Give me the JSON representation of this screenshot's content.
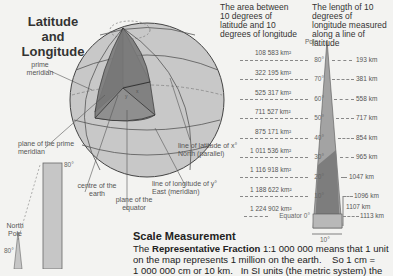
{
  "globe": {
    "title_line1": "Latitude and",
    "title_line2": "Longitude",
    "labels": {
      "prime_meridian": "prime meridian",
      "plane_prime_meridian": "plane of the prime meridian",
      "line_of_latitude": "line of latitude of x° North (parallel)",
      "line_of_longitude": "line of longitude of y° East (meridian)",
      "centre_of_earth": "centre of the earth",
      "plane_of_equator": "plane of the equator",
      "x": "x",
      "y": "y"
    },
    "colors": {
      "light": "#c8c8c8",
      "mid": "#8f8f8f",
      "dark": "#6e6e6e",
      "outline": "#444444"
    }
  },
  "left_mini": {
    "north_pole": "North Pole",
    "deg80_top": "80°",
    "deg80_left": "80°"
  },
  "area_column": {
    "header": "The area between 10 degrees of latitude and 10 degrees of longitude",
    "areas": [
      "108 583 km²",
      "322 195 km²",
      "525 317 km²",
      "711 527 km²",
      "875 171 km²",
      "1 011 536 km²",
      "1 116 918 km²",
      "1 188 622 km²",
      "1 224 902 km²"
    ]
  },
  "length_column": {
    "header": "The length of 10 degrees of longitude measured along a line of latitude",
    "pole": "Pole",
    "latitudes": [
      "80°",
      "70°",
      "60°",
      "50°",
      "40°",
      "30°",
      "20°",
      "10°",
      "Equator 0°"
    ],
    "lengths": [
      "193 km",
      "381 km",
      "558 km",
      "717 km",
      "854 km",
      "965 km",
      "1047 km",
      "1096 km",
      "1113 km"
    ],
    "meridian_length": "1107 km",
    "width_label": "10°"
  },
  "scale": {
    "heading": "Scale Measurement",
    "line1_prefix": "The ",
    "line1_bold": "Representative Fraction",
    "line1_rest": " 1:1 000 000 means that 1 unit",
    "line2": "on the map represents 1 million on the earth.    So 1 cm =",
    "line3": "1 000 000 cm or 10 km.   In SI units (the metric system) the"
  }
}
